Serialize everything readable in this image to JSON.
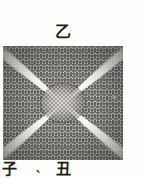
{
  "figure": {
    "caption_top": "乙",
    "caption_bottom_left": "子",
    "caption_bottom_separator": "、",
    "caption_bottom_right": "丑",
    "colors": {
      "page_background": "#fdfdfb",
      "block_ink": "#14110e",
      "ray_light": "#f8f7f3",
      "text": "#1d1a16"
    },
    "geometry": {
      "block_left": 3,
      "block_top": 46,
      "block_width": 120,
      "block_height": 114,
      "ray_count": 4,
      "ray_angles_deg": [
        -40,
        -140,
        140,
        40
      ],
      "center_x": 63,
      "center_y": 103
    }
  }
}
